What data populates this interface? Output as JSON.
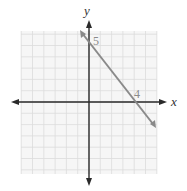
{
  "chart_data": {
    "type": "line",
    "title": "",
    "xlabel": "x",
    "ylabel": "y",
    "xlim": [
      -6,
      6
    ],
    "ylim": [
      -6,
      6
    ],
    "grid": true,
    "grid_step": 1,
    "series": [
      {
        "name": "line",
        "equation": "5x + 4y = 20",
        "x": [
          -1,
          6
        ],
        "y": [
          6.25,
          -2.5
        ],
        "color": "#8a8a8a"
      }
    ],
    "annotations": [
      {
        "text": "5",
        "x": 0,
        "y": 5,
        "meaning": "y-intercept"
      },
      {
        "text": "4",
        "x": 4,
        "y": 0,
        "meaning": "x-intercept"
      }
    ]
  },
  "labels": {
    "x_axis": "x",
    "y_axis": "y",
    "y_intercept": "5",
    "x_intercept": "4"
  },
  "colors": {
    "grid": "#dcdcdc",
    "grid_bg": "#f6f6f6",
    "axis": "#2a2a2a",
    "line": "#8a8a8a"
  }
}
